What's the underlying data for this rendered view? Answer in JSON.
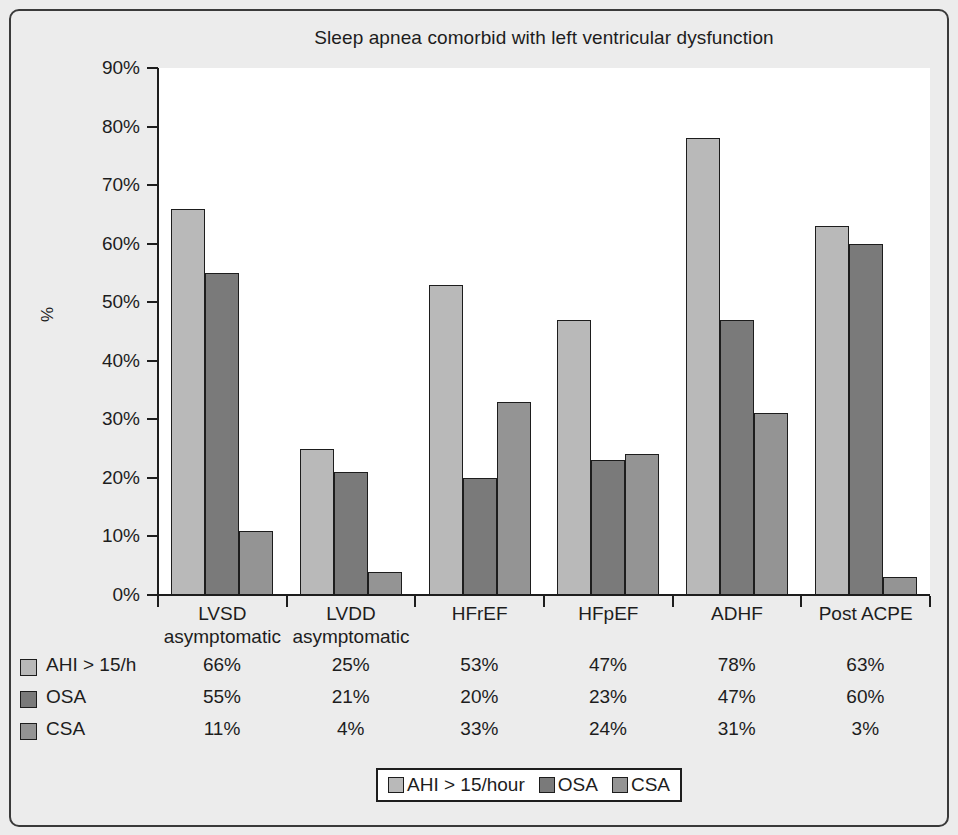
{
  "chart_data": {
    "type": "bar",
    "title": "Sleep apnea comorbid with left ventricular dysfunction",
    "xlabel": "",
    "ylabel": "%",
    "ylim": [
      0,
      90
    ],
    "ytick_labels": [
      "90%",
      "80%",
      "70%",
      "60%",
      "50%",
      "40%",
      "30%",
      "20%",
      "10%",
      "0%"
    ],
    "ytick_values": [
      90,
      80,
      70,
      60,
      50,
      40,
      30,
      20,
      10,
      0
    ],
    "grid": false,
    "legend_position": "bottom",
    "categories": [
      "LVSD\nasymptomatic",
      "LVDD\nasymptomatic",
      "HFrEF",
      "HFpEF",
      "ADHF",
      "Post ACPE"
    ],
    "category_lines": [
      [
        "LVSD",
        "asymptomatic"
      ],
      [
        "LVDD",
        "asymptomatic"
      ],
      [
        "HFrEF",
        ""
      ],
      [
        "HFpEF",
        ""
      ],
      [
        "ADHF",
        ""
      ],
      [
        "Post ACPE",
        ""
      ]
    ],
    "series": [
      {
        "name": "AHI > 15/hour",
        "table_name": "AHI > 15/h",
        "color": "#b9b9b9",
        "values": [
          66,
          25,
          53,
          47,
          78,
          63
        ],
        "labels": [
          "66%",
          "25%",
          "53%",
          "47%",
          "78%",
          "63%"
        ]
      },
      {
        "name": "OSA",
        "table_name": "OSA",
        "color": "#7a7a7a",
        "values": [
          55,
          21,
          20,
          23,
          47,
          60
        ],
        "labels": [
          "55%",
          "21%",
          "20%",
          "23%",
          "47%",
          "60%"
        ]
      },
      {
        "name": "CSA",
        "table_name": "CSA",
        "color": "#949494",
        "values": [
          11,
          4,
          33,
          24,
          31,
          3
        ],
        "labels": [
          "11%",
          "4%",
          "33%",
          "24%",
          "31%",
          "3%"
        ]
      }
    ]
  },
  "colors": {
    "background": "#ececec",
    "plot_background": "#ffffff",
    "axis": "#1d1d1d",
    "series_1": "#b9b9b9",
    "series_2": "#7a7a7a",
    "series_3": "#949494"
  }
}
